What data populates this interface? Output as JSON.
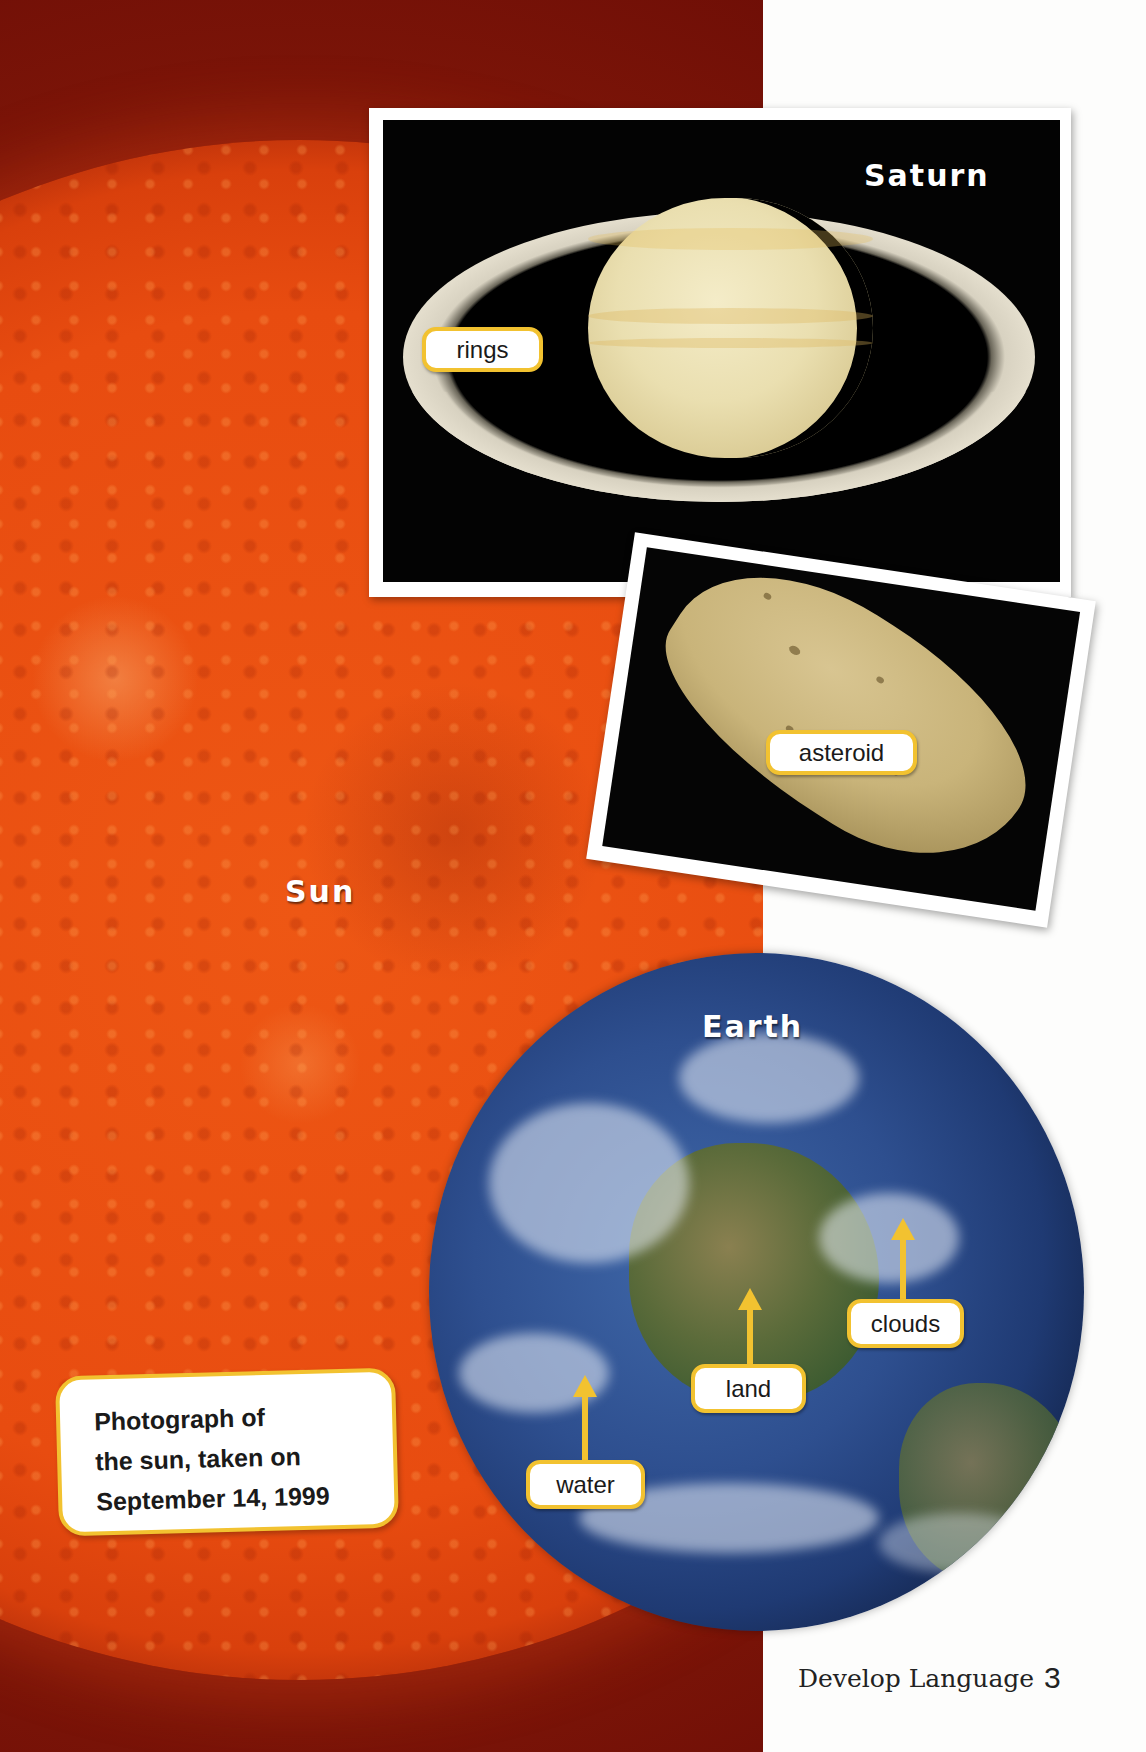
{
  "page": {
    "footer_label": "Develop Language",
    "page_number": "3"
  },
  "sun": {
    "label": "Sun",
    "caption_lines": [
      "Photograph of",
      "the sun, taken on",
      "September 14, 1999"
    ]
  },
  "saturn": {
    "title": "Saturn",
    "tags": {
      "rings": "rings"
    }
  },
  "asteroid": {
    "tag": "asteroid"
  },
  "earth": {
    "title": "Earth",
    "tags": {
      "clouds": "clouds",
      "land": "land",
      "water": "water"
    }
  },
  "colors": {
    "tag_border": "#f2c230",
    "sun_orange": "#e84c10",
    "sun_dark_red": "#6b0c06",
    "page_white": "#fdfdfc"
  }
}
